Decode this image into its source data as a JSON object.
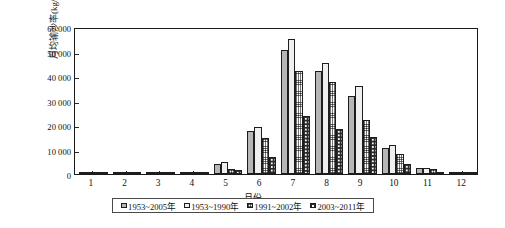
{
  "chart_data": {
    "type": "bar",
    "title": "",
    "xlabel": "月份",
    "ylabel": "月均输沙率(kg/s)",
    "categories": [
      "1",
      "2",
      "3",
      "4",
      "5",
      "6",
      "7",
      "8",
      "9",
      "10",
      "11",
      "12"
    ],
    "ylim": [
      0,
      60000
    ],
    "ytick_labels": [
      "0",
      "10 000",
      "20 000",
      "30 000",
      "40 000",
      "50 000",
      "60 000"
    ],
    "ytick_values": [
      0,
      10000,
      20000,
      30000,
      40000,
      50000,
      60000
    ],
    "grid": false,
    "legend_position": "bottom",
    "series": [
      {
        "name": "1953~2005年",
        "pattern": "solid-gray",
        "color": "#b6b6b6",
        "values": [
          60,
          60,
          180,
          800,
          4200,
          17500,
          50500,
          42200,
          32000,
          10500,
          2400,
          400
        ]
      },
      {
        "name": "1953~1990年",
        "pattern": "light-vertical-hatch",
        "color": "#efefef",
        "values": [
          60,
          60,
          180,
          1000,
          5000,
          19200,
          55000,
          45500,
          35800,
          11800,
          2600,
          400
        ]
      },
      {
        "name": "1991~2002年",
        "pattern": "crosshatch-grid",
        "color": "#ffffff",
        "values": [
          40,
          40,
          120,
          400,
          2200,
          14500,
          42200,
          37400,
          22200,
          8000,
          1900,
          250
        ]
      },
      {
        "name": "2003~2011年",
        "pattern": "dark-dotted",
        "color": "#2b2b2b",
        "values": [
          30,
          30,
          90,
          300,
          1500,
          7000,
          23700,
          18500,
          15000,
          4200,
          500,
          150
        ]
      }
    ]
  }
}
